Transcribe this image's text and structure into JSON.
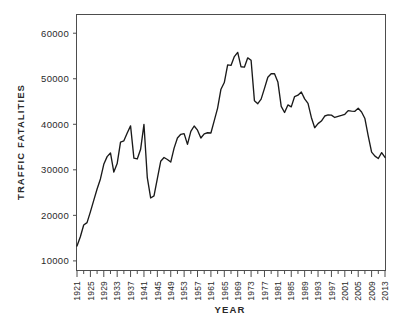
{
  "chart_data": {
    "type": "line",
    "title": "",
    "xlabel": "YEAR",
    "ylabel": "TRAFFIC FATALITIES",
    "xlim": [
      1921,
      2013
    ],
    "ylim": [
      8000,
      64000
    ],
    "grid": false,
    "legend": null,
    "y_ticks": [
      10000,
      20000,
      30000,
      40000,
      50000,
      60000
    ],
    "y_tick_labels": [
      "10000",
      "20000",
      "30000",
      "40000",
      "50000",
      "60000"
    ],
    "x_ticks": [
      1921,
      1925,
      1929,
      1933,
      1937,
      1941,
      1945,
      1949,
      1953,
      1957,
      1961,
      1965,
      1969,
      1973,
      1977,
      1981,
      1985,
      1989,
      1993,
      1997,
      2001,
      2005,
      2009,
      2013
    ],
    "x_tick_labels": [
      "1921",
      "1925",
      "1929",
      "1933",
      "1937",
      "1941",
      "1945",
      "1949",
      "1953",
      "1957",
      "1961",
      "1965",
      "1969",
      "1973",
      "1977",
      "1981",
      "1985",
      "1989",
      "1993",
      "1997",
      "2001",
      "2005",
      "2009",
      "2013"
    ],
    "x_tick_rotation": 90,
    "minor_x_ticks_every": 2,
    "series_name": "Traffic fatalities",
    "series_color": "#1a1a1a",
    "x": [
      1921,
      1922,
      1923,
      1924,
      1925,
      1926,
      1927,
      1928,
      1929,
      1930,
      1931,
      1932,
      1933,
      1934,
      1935,
      1936,
      1937,
      1938,
      1939,
      1940,
      1941,
      1942,
      1943,
      1944,
      1945,
      1946,
      1947,
      1948,
      1949,
      1950,
      1951,
      1952,
      1953,
      1954,
      1955,
      1956,
      1957,
      1958,
      1959,
      1960,
      1961,
      1962,
      1963,
      1964,
      1965,
      1966,
      1967,
      1968,
      1969,
      1970,
      1971,
      1972,
      1973,
      1974,
      1975,
      1976,
      1977,
      1978,
      1979,
      1980,
      1981,
      1982,
      1983,
      1984,
      1985,
      1986,
      1987,
      1988,
      1989,
      1990,
      1991,
      1992,
      1993,
      1994,
      1995,
      1996,
      1997,
      1998,
      1999,
      2000,
      2001,
      2002,
      2003,
      2004,
      2005,
      2006,
      2007,
      2008,
      2009,
      2010,
      2011,
      2012,
      2013
    ],
    "y": [
      13253,
      15300,
      17870,
      18400,
      20771,
      23300,
      25800,
      28000,
      31215,
      32900,
      33700,
      29500,
      31363,
      36101,
      36369,
      38089,
      39643,
      32582,
      32386,
      34501,
      39969,
      28309,
      23823,
      24282,
      28076,
      31874,
      32697,
      32259,
      31701,
      34763,
      36996,
      37794,
      37955,
      35586,
      38426,
      39628,
      38702,
      36981,
      37910,
      38137,
      38091,
      40804,
      43564,
      47700,
      49163,
      53041,
      52924,
      54862,
      55791,
      52627,
      52542,
      54589,
      54052,
      45196,
      44525,
      45523,
      47878,
      50331,
      51093,
      51091,
      49301,
      43945,
      42589,
      44257,
      43825,
      46087,
      46390,
      47087,
      45582,
      44599,
      41508,
      39250,
      40150,
      40716,
      41817,
      42065,
      42013,
      41501,
      41717,
      41945,
      42196,
      43005,
      42884,
      42836,
      43510,
      42708,
      41259,
      37423,
      33883,
      32999,
      32479,
      33782,
      32719
    ],
    "data_point_count": 93,
    "notes": ""
  }
}
